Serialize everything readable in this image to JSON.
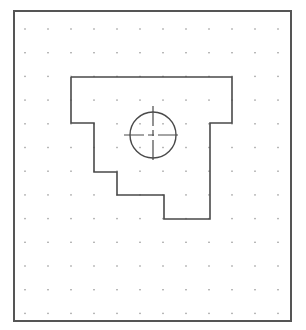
{
  "drawing": {
    "background": "#ffffff",
    "frame": {
      "x": 14,
      "y": 11,
      "width": 277,
      "height": 310,
      "stroke": "#555555",
      "stroke_width": 2
    },
    "grid": {
      "origin_x": 25,
      "origin_y": 29,
      "spacing_x": 23,
      "spacing_y": 23.7,
      "cols": 12,
      "rows": 13,
      "dot_color": "#9a9a9a",
      "dot_size": 1.4
    },
    "outline": {
      "stroke": "#4a4a4a",
      "stroke_width": 1.6,
      "points": [
        [
          71,
          77
        ],
        [
          232,
          77
        ],
        [
          232,
          123
        ],
        [
          210,
          123
        ],
        [
          210,
          219
        ],
        [
          164,
          219
        ],
        [
          164,
          195
        ],
        [
          117,
          195
        ],
        [
          117,
          172
        ],
        [
          94,
          172
        ],
        [
          94,
          123
        ],
        [
          71,
          123
        ],
        [
          71,
          77
        ]
      ]
    },
    "hole": {
      "cx": 153,
      "cy": 135,
      "r": 23,
      "stroke": "#4a4a4a",
      "stroke_width": 1.4
    },
    "centerlines": {
      "stroke": "#4a4a4a",
      "stroke_width": 1.2,
      "horizontal": {
        "x1": 124,
        "x2": 182,
        "y": 135
      },
      "vertical": {
        "y1": 106,
        "y2": 164,
        "x": 153
      },
      "dash_pattern": "20 4 6 4"
    }
  }
}
